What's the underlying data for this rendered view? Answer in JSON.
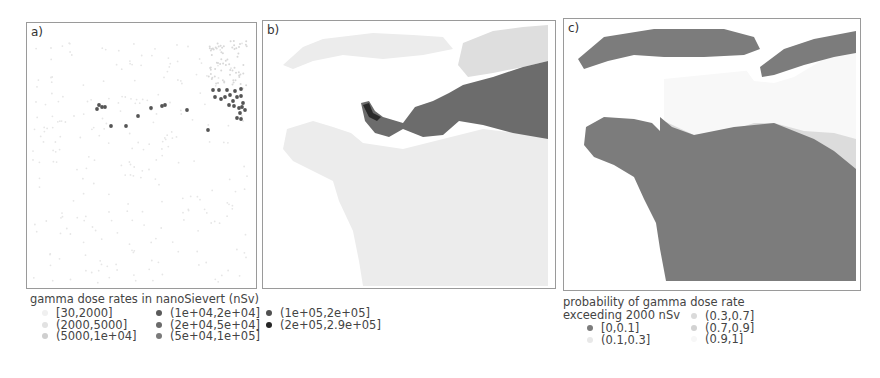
{
  "figure": {
    "panels": [
      {
        "id": "a",
        "label": "a)",
        "kind": "point observations"
      },
      {
        "id": "b",
        "label": "b)",
        "kind": "interpolated dose rate map"
      },
      {
        "id": "c",
        "label": "c)",
        "kind": "exceedance probability map"
      }
    ]
  },
  "legend_dose": {
    "title": "gamma dose rates in nanoSievert (nSv)",
    "items": [
      {
        "label": "[30,2000]",
        "color": "#f0f0f0"
      },
      {
        "label": "(2000,5000]",
        "color": "#e2e2e2"
      },
      {
        "label": "(5000,1e+04]",
        "color": "#cfcfcf"
      },
      {
        "label": "(1e+04,2e+04]",
        "color": "#5a5a5a"
      },
      {
        "label": "(2e+04,5e+04]",
        "color": "#6b6b6b"
      },
      {
        "label": "(5e+04,1e+05]",
        "color": "#7a7a7a"
      },
      {
        "label": "(1e+05,2e+05]",
        "color": "#505050"
      },
      {
        "label": "(2e+05,2.9e+05]",
        "color": "#262626"
      }
    ]
  },
  "legend_prob": {
    "title_line1": "probability of gamma dose rate",
    "title_line2": "exceeding 2000 nSv",
    "items": [
      {
        "label": "[0,0.1]",
        "color": "#7c7c7c"
      },
      {
        "label": "(0.1,0.3]",
        "color": "#e8e8e8"
      },
      {
        "label": "(0.3,0.7]",
        "color": "#dadada"
      },
      {
        "label": "(0.7,0.9]",
        "color": "#d2d2d2"
      },
      {
        "label": "(0.9,1]",
        "color": "#f7f7f7"
      }
    ]
  },
  "map_a": {
    "faint_points_color": "#e6e6e6",
    "high_points_color": "#555555",
    "high_points": [
      [
        72,
        82
      ],
      [
        75,
        84
      ],
      [
        70,
        86
      ],
      [
        78,
        84
      ],
      [
        84,
        103
      ],
      [
        99,
        103
      ],
      [
        111,
        93
      ],
      [
        124,
        85
      ],
      [
        135,
        83
      ],
      [
        138,
        82
      ],
      [
        160,
        87
      ],
      [
        181,
        107
      ],
      [
        186,
        67
      ],
      [
        192,
        67
      ],
      [
        200,
        67
      ],
      [
        208,
        68
      ],
      [
        214,
        66
      ],
      [
        188,
        74
      ],
      [
        194,
        76
      ],
      [
        198,
        74
      ],
      [
        203,
        72
      ],
      [
        206,
        78
      ],
      [
        210,
        74
      ],
      [
        214,
        73
      ],
      [
        216,
        80
      ],
      [
        202,
        82
      ],
      [
        207,
        83
      ],
      [
        212,
        85
      ],
      [
        215,
        84
      ],
      [
        218,
        87
      ],
      [
        213,
        90
      ],
      [
        210,
        95
      ],
      [
        214,
        96
      ]
    ]
  },
  "map_b": {
    "colors": {
      "low": "#ececec",
      "mid": "#dedede",
      "high": "#6c6c6c",
      "peak": "#2a2a2a"
    }
  },
  "map_c": {
    "colors": {
      "p0": "#7c7c7c",
      "p1": "#e9e9e9",
      "p3": "#dcdcdc",
      "p9": "#f8f8f8"
    }
  },
  "chart_data": [
    {
      "type": "scatter",
      "title": "a)",
      "description": "Point measurements of gamma dose rate; high values clustered in the north-east (upper right), a line of elevated points across the centre",
      "legend": [
        "[30,2000]",
        "(2000,5000]",
        "(5000,1e+04]",
        "(1e+04,2e+04]",
        "(2e+04,5e+04]",
        "(5e+04,1e+05]",
        "(1e+05,2e+05]",
        "(2e+05,2.9e+05]"
      ],
      "legend_title": "gamma dose rates in nanoSievert (nSv)"
    },
    {
      "type": "heatmap",
      "title": "b)",
      "description": "Interpolated dose-rate map; a dark plume extends from the upper-right edge westward to a peak near the centre-left coast",
      "legend_title": "gamma dose rates in nanoSievert (nSv)"
    },
    {
      "type": "heatmap",
      "title": "c)",
      "description": "Probability of gamma dose rate exceeding 2000 nSv; land largely [0,0.1], plume corridor (0.9,1], transition bands (0.3,0.7] and (0.7,0.9]",
      "legend": [
        "[0,0.1]",
        "(0.1,0.3]",
        "(0.3,0.7]",
        "(0.7,0.9]",
        "(0.9,1]"
      ],
      "legend_title": "probability of gamma dose rate exceeding 2000 nSv"
    }
  ]
}
